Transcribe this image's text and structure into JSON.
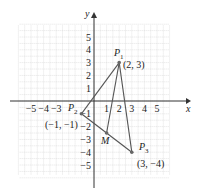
{
  "axes": {
    "x_label": "x",
    "y_label": "y",
    "x_ticks": [
      "−5",
      "−4",
      "−3",
      "1",
      "2",
      "3",
      "4",
      "5"
    ],
    "y_ticks": [
      "5",
      "4",
      "3",
      "2",
      "1",
      "−1",
      "−2",
      "−3",
      "−4",
      "−5"
    ],
    "x_tick_values": [
      -5,
      -4,
      -3,
      1,
      2,
      3,
      4,
      5
    ],
    "y_tick_values": [
      5,
      4,
      3,
      2,
      1,
      -1,
      -2,
      -3,
      -4,
      -5
    ]
  },
  "points": [
    {
      "name": "P",
      "sub": "1",
      "coord_label": "(2, 3)",
      "x": 2,
      "y": 3
    },
    {
      "name": "P",
      "sub": "2",
      "coord_label": "(−1, −1)",
      "x": -1,
      "y": -1
    },
    {
      "name": "P",
      "sub": "3",
      "coord_label": "(3, −4)",
      "x": 3,
      "y": -4
    },
    {
      "name": "M",
      "sub": "",
      "coord_label": "",
      "x": 1,
      "y": -2.5
    }
  ],
  "colors": {
    "grid": "#c8c8c8",
    "axis": "#333333",
    "line": "#555555",
    "point": "#666666"
  }
}
